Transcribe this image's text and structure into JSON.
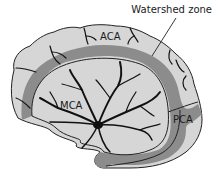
{
  "diagram": {
    "type": "anatomical",
    "labels": {
      "watershed": "Watershed zone",
      "aca": "ACA",
      "mca": "MCA",
      "pca": "PCA"
    },
    "colors": {
      "territory_fill": "#d6d6d6",
      "watershed_band": "#8c8c8c",
      "vessel": "#111111",
      "outline": "#222222",
      "background": "#ffffff"
    }
  }
}
